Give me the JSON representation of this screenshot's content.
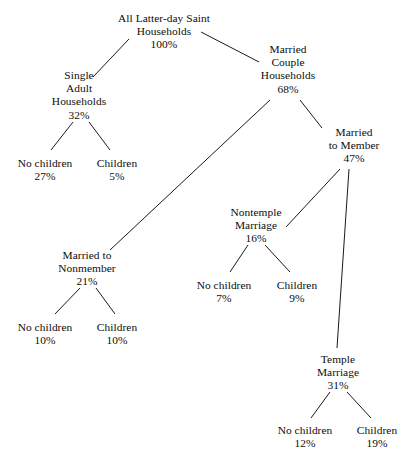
{
  "diagram": {
    "type": "tree",
    "line_color": "#1a1a1a",
    "background_color": "#ffffff",
    "text_color": "#0d0d0d",
    "nodes": [
      {
        "id": "root",
        "lines": [
          "All Latter-day Saint",
          "Households"
        ],
        "value": "100%",
        "cx": 164,
        "y": 12
      },
      {
        "id": "single-adult",
        "lines": [
          "Single",
          "Adult",
          "Households"
        ],
        "value": "32%",
        "cx": 79,
        "y": 69
      },
      {
        "id": "single-no-children",
        "lines": [
          "No children"
        ],
        "value": "27%",
        "cx": 45,
        "y": 157
      },
      {
        "id": "single-children",
        "lines": [
          "Children"
        ],
        "value": "5%",
        "cx": 117,
        "y": 157
      },
      {
        "id": "married-couple",
        "lines": [
          "Married",
          "Couple",
          "Households"
        ],
        "value": "68%",
        "cx": 288,
        "y": 43
      },
      {
        "id": "married-to-nonmember",
        "lines": [
          "Married to",
          "Nonmember"
        ],
        "value": "21%",
        "cx": 87,
        "y": 249
      },
      {
        "id": "nonmember-no-children",
        "lines": [
          "No children"
        ],
        "value": "10%",
        "cx": 45,
        "y": 321
      },
      {
        "id": "nonmember-children",
        "lines": [
          "Children"
        ],
        "value": "10%",
        "cx": 117,
        "y": 321
      },
      {
        "id": "married-to-member",
        "lines": [
          "Married",
          "to Member"
        ],
        "value": "47%",
        "cx": 354,
        "y": 126
      },
      {
        "id": "nontemple-marriage",
        "lines": [
          "Nontemple",
          "Marriage"
        ],
        "value": "16%",
        "cx": 256,
        "y": 206
      },
      {
        "id": "nontemple-no-children",
        "lines": [
          "No children"
        ],
        "value": "7%",
        "cx": 224,
        "y": 279
      },
      {
        "id": "nontemple-children",
        "lines": [
          "Children"
        ],
        "value": "9%",
        "cx": 297,
        "y": 279
      },
      {
        "id": "temple-marriage",
        "lines": [
          "Temple",
          "Marriage"
        ],
        "value": "31%",
        "cx": 338,
        "y": 353
      },
      {
        "id": "temple-no-children",
        "lines": [
          "No children"
        ],
        "value": "12%",
        "cx": 305,
        "y": 424
      },
      {
        "id": "temple-children",
        "lines": [
          "Children"
        ],
        "value": "19%",
        "cx": 377,
        "y": 424
      }
    ],
    "edges": [
      {
        "id": "root-to-single-adult",
        "from": "root",
        "to": "single-adult",
        "x1": 129,
        "y1": 39,
        "x2": 93,
        "y2": 77
      },
      {
        "id": "root-to-married-couple",
        "from": "root",
        "to": "married-couple",
        "x1": 201,
        "y1": 32,
        "x2": 259,
        "y2": 62
      },
      {
        "id": "single-adult-to-no-children",
        "from": "single-adult",
        "to": "single-no-children",
        "x1": 73,
        "y1": 122,
        "x2": 51,
        "y2": 150
      },
      {
        "id": "single-adult-to-children",
        "from": "single-adult",
        "to": "single-children",
        "x1": 89,
        "y1": 122,
        "x2": 110,
        "y2": 150
      },
      {
        "id": "married-couple-to-nonmember",
        "from": "married-couple",
        "to": "married-to-nonmember",
        "x1": 270,
        "y1": 100,
        "x2": 110,
        "y2": 250
      },
      {
        "id": "married-couple-to-member",
        "from": "married-couple",
        "to": "married-to-member",
        "x1": 300,
        "y1": 100,
        "x2": 322,
        "y2": 128
      },
      {
        "id": "nonmember-to-no-children",
        "from": "married-to-nonmember",
        "to": "nonmember-no-children",
        "x1": 80,
        "y1": 288,
        "x2": 55,
        "y2": 314
      },
      {
        "id": "nonmember-to-children",
        "from": "married-to-nonmember",
        "to": "nonmember-children",
        "x1": 96,
        "y1": 288,
        "x2": 115,
        "y2": 314
      },
      {
        "id": "member-to-nontemple",
        "from": "married-to-member",
        "to": "nontemple-marriage",
        "x1": 340,
        "y1": 169,
        "x2": 286,
        "y2": 227
      },
      {
        "id": "member-to-temple",
        "from": "married-to-member",
        "to": "temple-marriage",
        "x1": 349,
        "y1": 169,
        "x2": 337,
        "y2": 348
      },
      {
        "id": "nontemple-to-no-children",
        "from": "nontemple-marriage",
        "to": "nontemple-no-children",
        "x1": 248,
        "y1": 245,
        "x2": 230,
        "y2": 272
      },
      {
        "id": "nontemple-to-children",
        "from": "nontemple-marriage",
        "to": "nontemple-children",
        "x1": 265,
        "y1": 245,
        "x2": 290,
        "y2": 272
      },
      {
        "id": "temple-to-no-children",
        "from": "temple-marriage",
        "to": "temple-no-children",
        "x1": 330,
        "y1": 392,
        "x2": 311,
        "y2": 418
      },
      {
        "id": "temple-to-children",
        "from": "temple-marriage",
        "to": "temple-children",
        "x1": 347,
        "y1": 392,
        "x2": 371,
        "y2": 418
      }
    ]
  }
}
